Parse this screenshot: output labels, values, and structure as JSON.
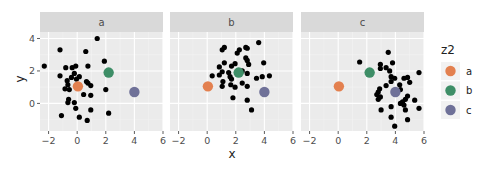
{
  "chart_data": {
    "type": "scatter",
    "title": "",
    "xlabel": "x",
    "ylabel": "y",
    "xlim": [
      -2.6,
      6.0
    ],
    "ylim": [
      -1.7,
      4.4
    ],
    "x_ticks": [
      -2,
      0,
      2,
      4,
      6
    ],
    "y_ticks": [
      0,
      2,
      4
    ],
    "grid": true,
    "facet_variable": "z1",
    "facets": [
      "a",
      "b",
      "c"
    ],
    "legend": {
      "title": "z2",
      "position": "right",
      "entries": [
        {
          "label": "a",
          "color": "#E3804F"
        },
        {
          "label": "b",
          "color": "#3E8E67"
        },
        {
          "label": "c",
          "color": "#6F7198"
        }
      ]
    },
    "group_means": [
      {
        "z2": "a",
        "x": 0.05,
        "y": 1.05,
        "color": "#E3804F"
      },
      {
        "z2": "b",
        "x": 2.2,
        "y": 1.9,
        "color": "#3E8E67"
      },
      {
        "z2": "c",
        "x": 4.0,
        "y": 0.7,
        "color": "#6F7198"
      }
    ],
    "series": [
      {
        "name": "a",
        "points": [
          [
            1.4,
            4.0
          ],
          [
            -1.2,
            3.3
          ],
          [
            0.6,
            3.2
          ],
          [
            -2.3,
            2.3
          ],
          [
            1.9,
            2.6
          ],
          [
            -0.8,
            2.2
          ],
          [
            -0.35,
            2.2
          ],
          [
            -0.1,
            2.3
          ],
          [
            0.75,
            2.3
          ],
          [
            -1.2,
            1.7
          ],
          [
            -0.7,
            1.4
          ],
          [
            -0.4,
            1.6
          ],
          [
            -0.2,
            1.85
          ],
          [
            0.15,
            1.65
          ],
          [
            0.65,
            1.35
          ],
          [
            0.75,
            1.25
          ],
          [
            0.95,
            1.1
          ],
          [
            -0.85,
            0.9
          ],
          [
            -0.55,
            0.85
          ],
          [
            0.45,
            0.55
          ],
          [
            0.95,
            0.5
          ],
          [
            2.0,
            0.85
          ],
          [
            -0.6,
            0.25
          ],
          [
            -0.65,
            0.05
          ],
          [
            -0.2,
            0.05
          ],
          [
            -0.1,
            -0.3
          ],
          [
            0.95,
            -0.4
          ],
          [
            2.2,
            -0.6
          ],
          [
            -1.1,
            -0.75
          ],
          [
            0.15,
            -0.85
          ],
          [
            0.7,
            -1.05
          ],
          [
            -0.65,
            1.15
          ],
          [
            -0.05,
            1.5
          ]
        ]
      },
      {
        "name": "b",
        "points": [
          [
            3.6,
            3.75
          ],
          [
            2.7,
            3.45
          ],
          [
            2.8,
            3.4
          ],
          [
            1.2,
            3.45
          ],
          [
            1.05,
            3.3
          ],
          [
            2.25,
            3.3
          ],
          [
            2.1,
            3.1
          ],
          [
            2.7,
            2.8
          ],
          [
            2.8,
            2.65
          ],
          [
            1.2,
            2.5
          ],
          [
            3.95,
            2.5
          ],
          [
            2.9,
            2.4
          ],
          [
            1.7,
            2.3
          ],
          [
            1.95,
            2.45
          ],
          [
            0.85,
            2.25
          ],
          [
            1.05,
            1.95
          ],
          [
            1.5,
            1.9
          ],
          [
            2.45,
            2.0
          ],
          [
            2.8,
            1.85
          ],
          [
            0.35,
            1.7
          ],
          [
            0.85,
            1.75
          ],
          [
            1.6,
            1.65
          ],
          [
            1.7,
            1.5
          ],
          [
            3.45,
            1.55
          ],
          [
            3.85,
            1.65
          ],
          [
            4.35,
            1.7
          ],
          [
            1.1,
            1.35
          ],
          [
            1.05,
            1.05
          ],
          [
            1.65,
            1.15
          ],
          [
            1.95,
            1.0
          ],
          [
            2.45,
            1.25
          ],
          [
            2.8,
            1.05
          ],
          [
            1.8,
            0.35
          ],
          [
            2.8,
            0.2
          ],
          [
            3.1,
            -0.4
          ]
        ]
      },
      {
        "name": "c",
        "points": [
          [
            3.5,
            3.15
          ],
          [
            1.5,
            2.55
          ],
          [
            3.8,
            2.5
          ],
          [
            2.95,
            2.4
          ],
          [
            2.95,
            2.15
          ],
          [
            3.35,
            2.2
          ],
          [
            3.6,
            2.0
          ],
          [
            5.65,
            1.9
          ],
          [
            3.7,
            1.65
          ],
          [
            3.95,
            1.55
          ],
          [
            4.6,
            1.55
          ],
          [
            4.85,
            1.6
          ],
          [
            5.0,
            1.3
          ],
          [
            3.7,
            1.35
          ],
          [
            3.35,
            1.1
          ],
          [
            4.3,
            1.15
          ],
          [
            2.9,
            0.9
          ],
          [
            2.8,
            0.7
          ],
          [
            4.35,
            0.85
          ],
          [
            2.7,
            0.55
          ],
          [
            2.95,
            0.4
          ],
          [
            4.85,
            0.45
          ],
          [
            4.7,
            0.25
          ],
          [
            4.5,
            0.1
          ],
          [
            5.35,
            0.2
          ],
          [
            4.35,
            0.0
          ],
          [
            2.8,
            0.25
          ],
          [
            4.6,
            -0.1
          ],
          [
            3.0,
            -0.4
          ],
          [
            3.7,
            -0.2
          ],
          [
            4.7,
            -0.4
          ],
          [
            5.65,
            -0.3
          ],
          [
            3.7,
            -0.85
          ],
          [
            4.85,
            -1.0
          ],
          [
            3.95,
            -1.4
          ]
        ]
      }
    ]
  },
  "style": {
    "panel_bg": "#EBEBEB",
    "strip_bg": "#D9D9D9",
    "grid_major": "#FFFFFF",
    "grid_minor": "#F4F4F4",
    "point_color": "#000000"
  }
}
